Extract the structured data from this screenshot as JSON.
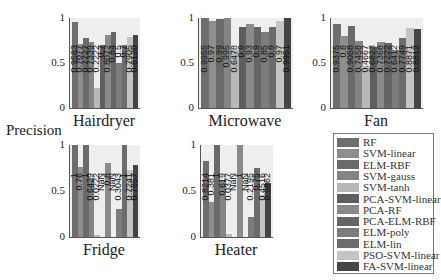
{
  "figure": {
    "ylabel": "Precision",
    "yticks": [
      "0",
      "0.5",
      "1"
    ]
  },
  "legend": {
    "items": [
      {
        "label": "RF",
        "color": "#6e6e6e"
      },
      {
        "label": "SVM-linear",
        "color": "#8e8e8e"
      },
      {
        "label": "ELM-RBF",
        "color": "#6a6a6a"
      },
      {
        "label": "SVM-gauss",
        "color": "#848484"
      },
      {
        "label": "SVM-tanh",
        "color": "#b8b8b8"
      },
      {
        "label": "PCA-SVM-linear",
        "color": "#5e5e5e"
      },
      {
        "label": "PCA-RF",
        "color": "#8a8a8a"
      },
      {
        "label": "PCA-ELM-RBF",
        "color": "#656565"
      },
      {
        "label": "ELM-poly",
        "color": "#7c7c7c"
      },
      {
        "label": "ELM-lin",
        "color": "#6c6c6c"
      },
      {
        "label": "PSO-SVM-linear",
        "color": "#c4c4c4"
      },
      {
        "label": "FA-SVM-linear",
        "color": "#444444"
      }
    ]
  },
  "chart_data": [
    {
      "type": "bar",
      "title": "Hairdryer",
      "xlabel": "",
      "ylabel": "Precision",
      "ylim": [
        0,
        1
      ],
      "categories": [
        "RF",
        "SVM-linear",
        "ELM-RBF",
        "SVM-gauss",
        "SVM-tanh",
        "PCA-SVM-linear",
        "PCA-RF",
        "PCA-ELM-RBF",
        "ELM-poly",
        "ELM-lin",
        "PSO-SVM-linear",
        "FA-SVM-linear"
      ],
      "values": [
        0.9583,
        0.7077,
        0.7727,
        0.7339,
        0.2222,
        0.7,
        0.8072,
        0.84,
        0.5,
        0.7,
        0.7905,
        0.812
      ],
      "labels": [
        "0.9583",
        "0.7077",
        "0.7727",
        "0.7339",
        "0.2222",
        "0.7",
        "0.8072",
        "0.84",
        "0.5",
        "0.7",
        "0.7905",
        "0.8120"
      ]
    },
    {
      "type": "bar",
      "title": "Microwave",
      "xlabel": "",
      "ylabel": "",
      "ylim": [
        0,
        1
      ],
      "categories": [
        "RF",
        "SVM-linear",
        "ELM-RBF",
        "SVM-gauss",
        "SVM-tanh",
        "PCA-SVM-linear",
        "PCA-RF",
        "PCA-ELM-RBF",
        "ELM-poly",
        "ELM-lin",
        "PSO-SVM-linear",
        "FA-SVM-linear"
      ],
      "values": [
        0.9955,
        0.97,
        0.99,
        0.995,
        0.6478,
        0.9,
        0.93,
        0.9,
        0.85,
        0.9,
        0.97,
        0.9951
      ],
      "labels": [
        "0.9955",
        "0.97",
        "0.99",
        "0.995",
        "0.6478",
        "0.9",
        "0.93",
        "0.9",
        "0.85",
        "0.9",
        "0.97",
        "0.9951"
      ]
    },
    {
      "type": "bar",
      "title": "Fan",
      "xlabel": "",
      "ylabel": "",
      "ylim": [
        0,
        1
      ],
      "categories": [
        "RF",
        "SVM-linear",
        "ELM-RBF",
        "SVM-gauss",
        "SVM-tanh",
        "PCA-SVM-linear",
        "PCA-RF",
        "PCA-ELM-RBF",
        "ELM-poly",
        "ELM-lin",
        "PSO-SVM-linear",
        "FA-SVM-linear"
      ],
      "values": [
        0.9375,
        0.8,
        0.9058,
        0.7458,
        0.4667,
        0.6823,
        0.7368,
        0.7222,
        0.6412,
        0.7749,
        0.8871,
        0.8812
      ],
      "labels": [
        "0.9375",
        "0.8",
        "0.9058",
        "0.7458",
        "0.4667",
        "0.6823",
        "0.7368",
        "0.7222",
        "0.6412",
        "0.7749",
        "0.8871",
        "0.8812"
      ]
    },
    {
      "type": "bar",
      "title": "Fridge",
      "xlabel": "",
      "ylabel": "Precision",
      "ylim": [
        0,
        1
      ],
      "categories": [
        "RF",
        "SVM-linear",
        "ELM-RBF",
        "SVM-gauss",
        "SVM-tanh",
        "PCA-SVM-linear",
        "PCA-RF",
        "PCA-ELM-RBF",
        "ELM-poly",
        "ELM-lin",
        "PSO-SVM-linear",
        "FA-SVM-linear"
      ],
      "values": [
        1,
        0.76,
        1,
        0.6429,
        0.0222,
        null,
        0.8,
        null,
        0.3043,
        1,
        0.7241,
        0.7857
      ],
      "labels": [
        "1",
        "0.76",
        "1",
        "0.6429",
        "0.0222",
        "NaN",
        "0.8",
        "NaN",
        "0.3043",
        "1",
        "0.7241",
        "0.7857"
      ]
    },
    {
      "type": "bar",
      "title": "Heater",
      "xlabel": "",
      "ylabel": "",
      "ylim": [
        0,
        1
      ],
      "categories": [
        "RF",
        "SVM-linear",
        "ELM-RBF",
        "SVM-gauss",
        "SVM-tanh",
        "PCA-SVM-linear",
        "PCA-RF",
        "PCA-ELM-RBF",
        "ELM-poly",
        "ELM-lin",
        "PSO-SVM-linear",
        "FA-SVM-linear"
      ],
      "values": [
        0.8214,
        0.381,
        1,
        0.619,
        0.0377,
        null,
        1,
        null,
        0.2195,
        0.75,
        0.4516,
        0.5862
      ],
      "labels": [
        "0.8214",
        "0.381",
        "1",
        "0.619",
        "0.0377",
        "NaN",
        "1",
        "NaN",
        "0.2195",
        "0.75",
        "0.4516",
        "0.5862"
      ]
    }
  ],
  "layout": {
    "panels": [
      {
        "left": 69,
        "top": 18,
        "width": 70,
        "height": 90
      },
      {
        "left": 198,
        "top": 18,
        "width": 94,
        "height": 90
      },
      {
        "left": 330,
        "top": 18,
        "width": 92,
        "height": 90
      },
      {
        "left": 69,
        "top": 145,
        "width": 70,
        "height": 92
      },
      {
        "left": 200,
        "top": 145,
        "width": 72,
        "height": 92
      }
    ]
  }
}
